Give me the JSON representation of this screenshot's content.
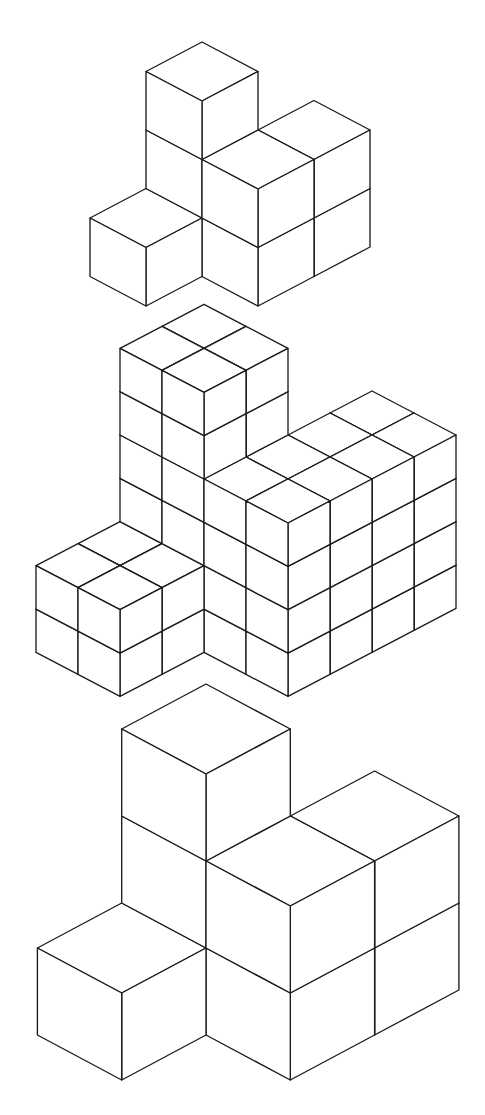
{
  "diagram": {
    "type": "isometric-cube-figures",
    "background": "#ffffff",
    "line_color": "#1c1c1c",
    "face_color": "#ffffff",
    "structure_cells": [
      {
        "i": 0,
        "j": 0,
        "height": 3
      },
      {
        "i": 1,
        "j": 0,
        "height": 2
      },
      {
        "i": 1,
        "j": -1,
        "height": 2
      },
      {
        "i": 0,
        "j": 1,
        "height": 1
      }
    ],
    "figures": [
      {
        "name": "figure-top",
        "description": "8-cube isometric structure",
        "origin": [
          202,
          217.5
        ],
        "axis_i": [
          56,
          29.5
        ],
        "axis_j": [
          -56,
          29.5
        ],
        "axis_k": [
          0,
          -58.5
        ],
        "subdivide": 1
      },
      {
        "name": "figure-middle",
        "description": "Same structure, each cube subdivided into 2x2x2 small cubes",
        "origin": [
          204,
          564.4
        ],
        "axis_i": [
          84,
          44
        ],
        "axis_j": [
          -84,
          44
        ],
        "axis_k": [
          0,
          -86.7
        ],
        "subdivide": 2
      },
      {
        "name": "figure-bottom",
        "description": "Same structure drawn at larger scale",
        "origin": [
          206,
          945
        ],
        "axis_i": [
          84.3,
          45
        ],
        "axis_j": [
          -84.3,
          45
        ],
        "axis_k": [
          0,
          -87
        ],
        "subdivide": 1
      }
    ]
  }
}
